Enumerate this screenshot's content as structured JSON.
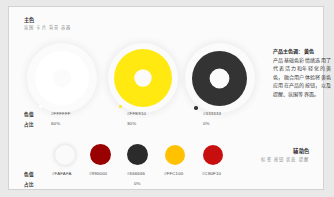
{
  "page": {
    "background": "#e9e9e9",
    "card_background": "#fbfbfb",
    "card_border": "#d2d2d2"
  },
  "headings": {
    "primary_title": "主色",
    "primary_subtitle": "氛围 卡片 背景 容器",
    "auxiliary_title": "辅助色",
    "auxiliary_subtitle": "标签 按钮 状态 提醒"
  },
  "note": {
    "title": "产品主色调：黄色",
    "body": "产品基础色彩情绪选用了代表活力和年轻化的黄色，融合用户体验将黄色应用在产品的按钮，以及提醒、氛围等界面。"
  },
  "labels": {
    "color_value": "色值",
    "ratio": "占比"
  },
  "primary_colors": [
    {
      "hex": "#FFFFFF",
      "ratio": "60%",
      "ring": "#FFFFFF",
      "swatch": "#FFFFFF"
    },
    {
      "hex": "#FFE910",
      "ratio": "30%",
      "ring": "#FFE910",
      "swatch": "#FFE910"
    },
    {
      "hex": "#333333",
      "ratio": "0%",
      "ring": "#333333",
      "swatch": "#333333"
    }
  ],
  "auxiliary_colors": [
    {
      "hex": "#FAFAFA",
      "ratio": "",
      "swatch": "#FAFAFA"
    },
    {
      "hex": "#990000",
      "ratio": "",
      "swatch": "#990000"
    },
    {
      "hex": "#666666",
      "ratio": "0%",
      "swatch": "#2b2b2b"
    },
    {
      "hex": "#FFC100",
      "ratio": "",
      "swatch": "#FFC100"
    },
    {
      "hex": "#C80F10",
      "ratio": "",
      "swatch": "#C80F10"
    }
  ]
}
